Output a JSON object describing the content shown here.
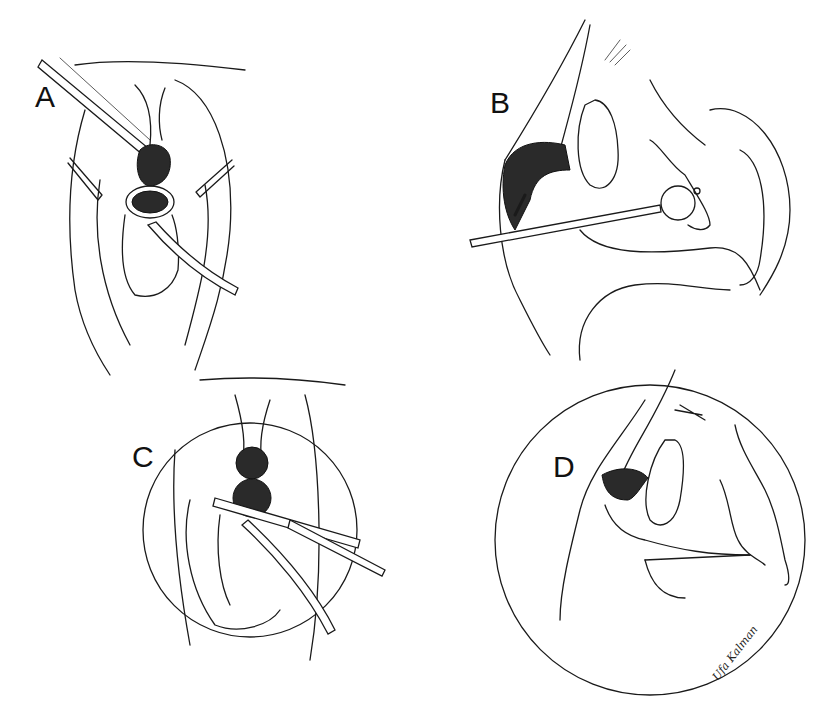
{
  "figure": {
    "type": "surgical line illustration",
    "background": "#ffffff",
    "ink": "#1a1a1a",
    "panels": [
      {
        "id": "A",
        "label": "A",
        "view": "frontal operative view with retractors, instrument and catheter"
      },
      {
        "id": "B",
        "label": "B",
        "view": "sagittal cross-section with catheter and balloon, arrow at mass"
      },
      {
        "id": "C",
        "label": "C",
        "view": "circular inset, frontal view with clamp/forceps and catheter"
      },
      {
        "id": "D",
        "label": "D",
        "view": "circular inset, sagittal cross-section after excision"
      }
    ],
    "signature": "Ufa Kalman"
  }
}
